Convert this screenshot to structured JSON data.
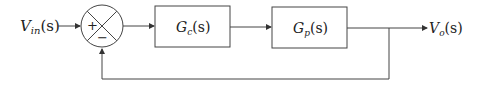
{
  "diagram": {
    "type": "feedback-control-block-diagram",
    "input_label": "V",
    "input_sub": "in",
    "input_arg": "(s)",
    "output_label": "V",
    "output_sub": "o",
    "output_arg": "(s)",
    "summing_junction": {
      "plus_sign": "+",
      "minus_sign": "−"
    },
    "blocks": [
      {
        "name": "G",
        "sub": "c",
        "arg": "(s)"
      },
      {
        "name": "G",
        "sub": "p",
        "arg": "(s)"
      }
    ],
    "feedback": "unity negative feedback"
  }
}
